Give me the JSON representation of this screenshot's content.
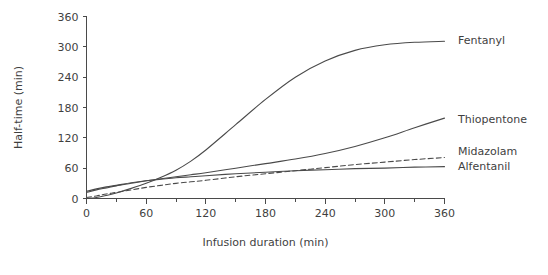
{
  "chart_data": {
    "type": "line",
    "title": "",
    "xlabel": "Infusion duration (min)",
    "ylabel": "Half-time (min)",
    "xlim": [
      0,
      360
    ],
    "ylim": [
      0,
      360
    ],
    "x_ticks": [
      0,
      60,
      120,
      180,
      240,
      300,
      360
    ],
    "x_tick_labels": [
      "0",
      "60",
      "120",
      "180",
      "240",
      "300",
      "360"
    ],
    "x_minor_ticks": [
      30,
      90,
      150,
      210,
      270,
      330
    ],
    "y_ticks": [
      0,
      60,
      120,
      180,
      240,
      300,
      360
    ],
    "y_tick_labels": [
      "0",
      "60",
      "120",
      "180",
      "240",
      "300",
      "360"
    ],
    "grid": false,
    "legend_position": "right-inline",
    "x": [
      0,
      10,
      20,
      30,
      45,
      60,
      75,
      90,
      105,
      120,
      150,
      180,
      210,
      240,
      270,
      300,
      330,
      360
    ],
    "series": [
      {
        "name": "Fentanyl",
        "label": "Fentanyl",
        "style": "solid",
        "color": "#4a4a4a",
        "label_x": 366,
        "label_y": 311,
        "values": [
          0,
          2,
          6,
          11,
          20,
          30,
          42,
          56,
          74,
          96,
          146,
          196,
          240,
          272,
          293,
          304,
          309,
          311
        ]
      },
      {
        "name": "Thiopentone",
        "label": "Thiopentone",
        "style": "solid",
        "color": "#4a4a4a",
        "label_x": 366,
        "label_y": 156,
        "values": [
          12,
          17,
          21,
          25,
          30,
          35,
          39,
          43,
          47,
          51,
          60,
          69,
          78,
          89,
          103,
          120,
          140,
          159
        ]
      },
      {
        "name": "Midazolam",
        "label": "Midazolam",
        "style": "dashed",
        "color": "#4a4a4a",
        "label_x": 366,
        "label_y": 92,
        "values": [
          2,
          5,
          9,
          12,
          17,
          22,
          26,
          30,
          33,
          36,
          43,
          49,
          55,
          61,
          67,
          72,
          77,
          81
        ]
      },
      {
        "name": "Alfentanil",
        "label": "Alfentanil",
        "style": "solid",
        "color": "#4a4a4a",
        "label_x": 366,
        "label_y": 62,
        "values": [
          14,
          19,
          23,
          26,
          31,
          35,
          38,
          41,
          43,
          45,
          49,
          52,
          55,
          57,
          59,
          60,
          62,
          63
        ]
      }
    ]
  },
  "legend": {
    "fentanyl": "Fentanyl",
    "thiopentone": "Thiopentone",
    "midazolam": "Midazolam",
    "alfentanil": "Alfentanil"
  },
  "colors": {
    "line": "#4a4a4a",
    "text": "#3f3f3f",
    "background": "#ffffff"
  }
}
